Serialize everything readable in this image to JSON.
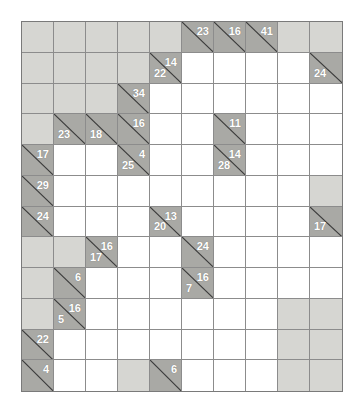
{
  "puzzle": {
    "type": "kakuro",
    "rows": 12,
    "cols": 10,
    "colors": {
      "page_background": "#ffffff",
      "blank_cell": "#d6d6d2",
      "clue_cell": "#a9a9a5",
      "entry_cell": "#ffffff",
      "grid_line": "#8c8c8c",
      "border": "#7a7a7a",
      "clue_text": "#ffffff",
      "slash": "#3b3b3b"
    },
    "cells": [
      [
        {
          "kind": "blank"
        },
        {
          "kind": "blank"
        },
        {
          "kind": "blank"
        },
        {
          "kind": "blank"
        },
        {
          "kind": "blank"
        },
        {
          "kind": "clue",
          "down": "23"
        },
        {
          "kind": "clue",
          "down": "16"
        },
        {
          "kind": "clue",
          "down": "41"
        },
        {
          "kind": "blank"
        },
        {
          "kind": "blank"
        }
      ],
      [
        {
          "kind": "blank"
        },
        {
          "kind": "blank"
        },
        {
          "kind": "blank"
        },
        {
          "kind": "blank"
        },
        {
          "kind": "clue",
          "down": "14",
          "across": "22"
        },
        {
          "kind": "white"
        },
        {
          "kind": "white"
        },
        {
          "kind": "white"
        },
        {
          "kind": "white"
        },
        {
          "kind": "clue",
          "across": "24"
        }
      ],
      [
        {
          "kind": "blank"
        },
        {
          "kind": "blank"
        },
        {
          "kind": "blank"
        },
        {
          "kind": "clue",
          "down": "34"
        },
        {
          "kind": "white"
        },
        {
          "kind": "white"
        },
        {
          "kind": "white"
        },
        {
          "kind": "white"
        },
        {
          "kind": "white"
        },
        {
          "kind": "white"
        }
      ],
      [
        {
          "kind": "blank"
        },
        {
          "kind": "clue",
          "across": "23"
        },
        {
          "kind": "clue",
          "across": "18"
        },
        {
          "kind": "clue",
          "down": "16"
        },
        {
          "kind": "white"
        },
        {
          "kind": "white"
        },
        {
          "kind": "clue",
          "down": "11"
        },
        {
          "kind": "white"
        },
        {
          "kind": "white"
        },
        {
          "kind": "white"
        }
      ],
      [
        {
          "kind": "clue",
          "down": "17"
        },
        {
          "kind": "white"
        },
        {
          "kind": "white"
        },
        {
          "kind": "clue",
          "down": "4",
          "across": "25"
        },
        {
          "kind": "white"
        },
        {
          "kind": "white"
        },
        {
          "kind": "clue",
          "down": "14",
          "across": "28"
        },
        {
          "kind": "white"
        },
        {
          "kind": "white"
        },
        {
          "kind": "white"
        }
      ],
      [
        {
          "kind": "clue",
          "down": "29"
        },
        {
          "kind": "white"
        },
        {
          "kind": "white"
        },
        {
          "kind": "white"
        },
        {
          "kind": "white"
        },
        {
          "kind": "white"
        },
        {
          "kind": "white"
        },
        {
          "kind": "white"
        },
        {
          "kind": "white"
        },
        {
          "kind": "blank"
        }
      ],
      [
        {
          "kind": "clue",
          "down": "24"
        },
        {
          "kind": "white"
        },
        {
          "kind": "white"
        },
        {
          "kind": "white"
        },
        {
          "kind": "clue",
          "down": "13",
          "across": "20"
        },
        {
          "kind": "white"
        },
        {
          "kind": "white"
        },
        {
          "kind": "white"
        },
        {
          "kind": "white"
        },
        {
          "kind": "clue",
          "across": "17"
        }
      ],
      [
        {
          "kind": "blank"
        },
        {
          "kind": "blank"
        },
        {
          "kind": "clue",
          "down": "16",
          "across": "17"
        },
        {
          "kind": "white"
        },
        {
          "kind": "white"
        },
        {
          "kind": "clue",
          "down": "24"
        },
        {
          "kind": "white"
        },
        {
          "kind": "white"
        },
        {
          "kind": "white"
        },
        {
          "kind": "white"
        }
      ],
      [
        {
          "kind": "blank"
        },
        {
          "kind": "clue",
          "down": "6"
        },
        {
          "kind": "white"
        },
        {
          "kind": "white"
        },
        {
          "kind": "white"
        },
        {
          "kind": "clue",
          "down": "16",
          "across": "7"
        },
        {
          "kind": "white"
        },
        {
          "kind": "white"
        },
        {
          "kind": "white"
        },
        {
          "kind": "white"
        }
      ],
      [
        {
          "kind": "blank"
        },
        {
          "kind": "clue",
          "down": "16",
          "across": "5"
        },
        {
          "kind": "white"
        },
        {
          "kind": "white"
        },
        {
          "kind": "white"
        },
        {
          "kind": "white"
        },
        {
          "kind": "white"
        },
        {
          "kind": "white"
        },
        {
          "kind": "blank"
        },
        {
          "kind": "blank"
        }
      ],
      [
        {
          "kind": "clue",
          "down": "22"
        },
        {
          "kind": "white"
        },
        {
          "kind": "white"
        },
        {
          "kind": "white"
        },
        {
          "kind": "white"
        },
        {
          "kind": "white"
        },
        {
          "kind": "white"
        },
        {
          "kind": "white"
        },
        {
          "kind": "blank"
        },
        {
          "kind": "blank"
        }
      ],
      [
        {
          "kind": "clue",
          "down": "4"
        },
        {
          "kind": "white"
        },
        {
          "kind": "white"
        },
        {
          "kind": "blank"
        },
        {
          "kind": "clue",
          "down": "6"
        },
        {
          "kind": "white"
        },
        {
          "kind": "white"
        },
        {
          "kind": "white"
        },
        {
          "kind": "blank"
        },
        {
          "kind": "blank"
        }
      ]
    ]
  }
}
